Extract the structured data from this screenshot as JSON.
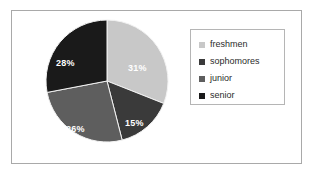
{
  "chart_data": {
    "type": "pie",
    "title": "",
    "categories": [
      "freshmen",
      "sophomores",
      "junior",
      "senior"
    ],
    "values": [
      31,
      15,
      26,
      28
    ],
    "value_labels": [
      "31%",
      "15%",
      "26%",
      "28%"
    ],
    "units": "percent",
    "colors": [
      "#c8c8c8",
      "#3a3a3a",
      "#5e5e5e",
      "#1a1a1a"
    ],
    "legend": {
      "position": "right",
      "border": true,
      "entries": [
        {
          "label": "freshmen",
          "color": "#c8c8c8",
          "marker": "square"
        },
        {
          "label": "sophomores",
          "color": "#3a3a3a",
          "marker": "square"
        },
        {
          "label": "junior",
          "color": "#5e5e5e",
          "marker": "square"
        },
        {
          "label": "senior",
          "color": "#1a1a1a",
          "marker": "square"
        }
      ]
    },
    "start_angle_deg": 0,
    "direction": "clockwise",
    "label_color": "#ffffff",
    "plot_background": "#ffffff",
    "frame_color": "#a9a9a9",
    "grid": false
  },
  "slices": [
    {
      "name": "freshmen",
      "label": "31%",
      "value": 31,
      "color": "#c8c8c8"
    },
    {
      "name": "sophomores",
      "label": "15%",
      "value": 15,
      "color": "#3a3a3a"
    },
    {
      "name": "junior",
      "label": "26%",
      "value": 26,
      "color": "#5e5e5e"
    },
    {
      "name": "senior",
      "label": "28%",
      "value": 28,
      "color": "#1a1a1a"
    }
  ]
}
